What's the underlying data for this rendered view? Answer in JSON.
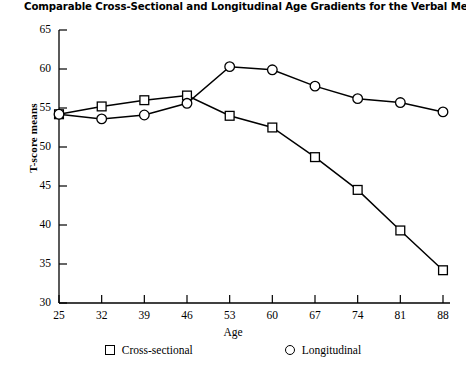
{
  "chart_data": {
    "type": "line",
    "title": "Comparable Cross-Sectional and Longitudinal Age Gradients for the Verbal Meaning Test.",
    "xlabel": "Age",
    "ylabel": "T-score means",
    "x": [
      25,
      32,
      39,
      46,
      53,
      60,
      67,
      74,
      81,
      88
    ],
    "xtick_labels": [
      "25",
      "32",
      "39",
      "46",
      "53",
      "60",
      "67",
      "74",
      "81",
      "88"
    ],
    "ytick_labels": [
      "30",
      "35",
      "40",
      "45",
      "50",
      "55",
      "60",
      "65"
    ],
    "yticks": [
      30,
      35,
      40,
      45,
      50,
      55,
      60,
      65
    ],
    "xlim": [
      25,
      88
    ],
    "ylim": [
      30,
      65
    ],
    "grid": false,
    "legend_position": "bottom",
    "series": [
      {
        "name": "Cross-sectional",
        "marker": "square",
        "values": [
          54.2,
          55.2,
          56.0,
          56.6,
          54.0,
          52.5,
          48.7,
          44.5,
          39.3,
          34.2
        ]
      },
      {
        "name": "Longitudinal",
        "marker": "circle",
        "values": [
          54.2,
          53.6,
          54.1,
          55.6,
          60.3,
          59.9,
          57.8,
          56.2,
          55.7,
          54.5
        ]
      }
    ]
  },
  "legend": {
    "items": [
      {
        "label": "Cross-sectional",
        "marker": "square"
      },
      {
        "label": "Longitudinal",
        "marker": "circle"
      }
    ]
  },
  "colors": {
    "line": "#000000",
    "axis": "#000000",
    "background": "#ffffff"
  }
}
